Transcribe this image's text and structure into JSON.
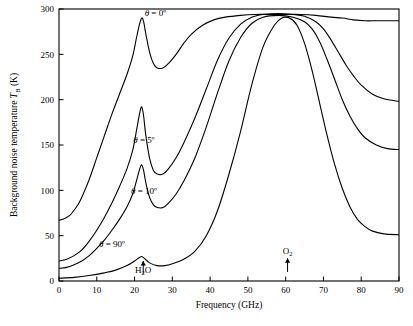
{
  "chart_data": {
    "type": "line",
    "title": "",
    "xlabel": "Frequency (GHz)",
    "ylabel": "Background noise temperature T_B (K)",
    "ylabel_main": "Background noise temperature ",
    "ylabel_italic": "T",
    "ylabel_sub": "B",
    "ylabel_unit": " (K)",
    "xlim": [
      0,
      90
    ],
    "ylim": [
      0,
      300
    ],
    "xticks": [
      0,
      10,
      20,
      30,
      40,
      50,
      60,
      70,
      80,
      90
    ],
    "yticks": [
      0,
      50,
      100,
      150,
      200,
      250,
      300
    ],
    "grid": false,
    "legend_position": "inline-annotations",
    "annotations": [
      {
        "name": "theta-0",
        "text": "θ = 0º",
        "x": 25.5,
        "y": 292
      },
      {
        "name": "theta-5",
        "text": "θ = 5º",
        "x": 22.5,
        "y": 152
      },
      {
        "name": "theta-10",
        "text": "θ = 10º",
        "x": 22.5,
        "y": 96
      },
      {
        "name": "theta-90",
        "text": "θ = 90º",
        "x": 14.0,
        "y": 38
      },
      {
        "name": "h2o-label",
        "text": "H₂O",
        "x": 22.3,
        "y": 9
      },
      {
        "name": "o2-label",
        "text": "O₂",
        "x": 60.5,
        "y": 30
      }
    ],
    "series": [
      {
        "name": "theta = 0 degrees",
        "label": "θ = 0º",
        "points": [
          [
            0,
            67
          ],
          [
            1,
            68
          ],
          [
            2,
            70
          ],
          [
            3,
            73
          ],
          [
            4,
            78
          ],
          [
            5,
            84
          ],
          [
            6,
            92
          ],
          [
            8,
            112
          ],
          [
            10,
            136
          ],
          [
            12,
            160
          ],
          [
            14,
            184
          ],
          [
            16,
            206
          ],
          [
            18,
            228
          ],
          [
            19.5,
            248
          ],
          [
            20.5,
            268
          ],
          [
            21.3,
            283
          ],
          [
            21.9,
            290
          ],
          [
            22.4,
            286
          ],
          [
            23,
            272
          ],
          [
            24,
            252
          ],
          [
            25,
            240
          ],
          [
            26,
            235
          ],
          [
            27.5,
            235
          ],
          [
            29,
            240
          ],
          [
            31,
            250
          ],
          [
            33,
            262
          ],
          [
            35,
            272
          ],
          [
            38,
            282
          ],
          [
            41,
            288
          ],
          [
            44,
            291
          ],
          [
            48,
            293
          ],
          [
            52,
            294
          ],
          [
            56,
            294
          ],
          [
            60,
            294
          ],
          [
            64,
            294
          ],
          [
            68,
            293
          ],
          [
            72,
            291
          ],
          [
            75,
            290
          ],
          [
            78,
            288
          ],
          [
            81,
            287
          ],
          [
            84,
            287
          ],
          [
            87,
            287
          ],
          [
            90,
            287
          ]
        ]
      },
      {
        "name": "theta = 5 degrees",
        "label": "θ = 5º",
        "points": [
          [
            0,
            22
          ],
          [
            2,
            24
          ],
          [
            4,
            28
          ],
          [
            6,
            34
          ],
          [
            8,
            44
          ],
          [
            10,
            56
          ],
          [
            12,
            70
          ],
          [
            14,
            86
          ],
          [
            16,
            104
          ],
          [
            18,
            124
          ],
          [
            19.5,
            144
          ],
          [
            20.6,
            168
          ],
          [
            21.4,
            186
          ],
          [
            21.9,
            192
          ],
          [
            22.4,
            182
          ],
          [
            23,
            160
          ],
          [
            24,
            135
          ],
          [
            25,
            122
          ],
          [
            26,
            118
          ],
          [
            27.5,
            118
          ],
          [
            29,
            124
          ],
          [
            31,
            136
          ],
          [
            33,
            152
          ],
          [
            36,
            180
          ],
          [
            39,
            212
          ],
          [
            42,
            244
          ],
          [
            45,
            268
          ],
          [
            48,
            283
          ],
          [
            51,
            291
          ],
          [
            54,
            294
          ],
          [
            58,
            295
          ],
          [
            62,
            294
          ],
          [
            65,
            292
          ],
          [
            68,
            286
          ],
          [
            70,
            278
          ],
          [
            72,
            266
          ],
          [
            74,
            252
          ],
          [
            76,
            238
          ],
          [
            78,
            226
          ],
          [
            80,
            216
          ],
          [
            83,
            206
          ],
          [
            86,
            201
          ],
          [
            90,
            198
          ]
        ]
      },
      {
        "name": "theta = 10 degrees",
        "label": "θ = 10º",
        "points": [
          [
            0,
            14
          ],
          [
            2,
            15
          ],
          [
            4,
            18
          ],
          [
            6,
            22
          ],
          [
            8,
            28
          ],
          [
            10,
            36
          ],
          [
            12,
            45
          ],
          [
            14,
            56
          ],
          [
            16,
            68
          ],
          [
            18,
            82
          ],
          [
            19.5,
            96
          ],
          [
            20.6,
            112
          ],
          [
            21.4,
            124
          ],
          [
            21.9,
            128
          ],
          [
            22.4,
            122
          ],
          [
            23,
            108
          ],
          [
            24,
            92
          ],
          [
            25,
            84
          ],
          [
            26,
            81
          ],
          [
            27.5,
            81
          ],
          [
            29,
            86
          ],
          [
            31,
            96
          ],
          [
            33,
            110
          ],
          [
            36,
            136
          ],
          [
            39,
            170
          ],
          [
            42,
            208
          ],
          [
            45,
            243
          ],
          [
            48,
            268
          ],
          [
            51,
            284
          ],
          [
            54,
            291
          ],
          [
            58,
            293
          ],
          [
            62,
            291
          ],
          [
            65,
            286
          ],
          [
            67,
            278
          ],
          [
            69,
            264
          ],
          [
            71,
            244
          ],
          [
            73,
            222
          ],
          [
            75,
            200
          ],
          [
            77,
            182
          ],
          [
            79,
            168
          ],
          [
            81,
            158
          ],
          [
            84,
            150
          ],
          [
            87,
            146
          ],
          [
            90,
            145
          ]
        ]
      },
      {
        "name": "theta = 90 degrees",
        "label": "θ = 90º",
        "points": [
          [
            0,
            3
          ],
          [
            4,
            4
          ],
          [
            8,
            6
          ],
          [
            12,
            9
          ],
          [
            15,
            12
          ],
          [
            18,
            17
          ],
          [
            20,
            22
          ],
          [
            21.3,
            26
          ],
          [
            21.9,
            27
          ],
          [
            22.6,
            25
          ],
          [
            24,
            20
          ],
          [
            26,
            17
          ],
          [
            28,
            17
          ],
          [
            30,
            19
          ],
          [
            33,
            24
          ],
          [
            36,
            33
          ],
          [
            39,
            50
          ],
          [
            42,
            78
          ],
          [
            45,
            118
          ],
          [
            48,
            164
          ],
          [
            51,
            216
          ],
          [
            54,
            258
          ],
          [
            57,
            282
          ],
          [
            59,
            290
          ],
          [
            61,
            290
          ],
          [
            63,
            282
          ],
          [
            65,
            262
          ],
          [
            67,
            232
          ],
          [
            69,
            196
          ],
          [
            71,
            160
          ],
          [
            73,
            128
          ],
          [
            75,
            102
          ],
          [
            77,
            82
          ],
          [
            79,
            68
          ],
          [
            81,
            60
          ],
          [
            83,
            55
          ],
          [
            86,
            52
          ],
          [
            90,
            51
          ]
        ]
      }
    ]
  }
}
